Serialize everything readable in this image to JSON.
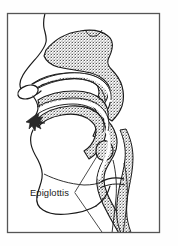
{
  "figure": {
    "kind": "anatomical-line-drawing",
    "frame": {
      "visible": true,
      "stroke_color": "#555555",
      "x": 7,
      "y": 13,
      "width": 153,
      "height": 220
    },
    "background_color": "#fefefe",
    "ink_color": "#1a1a1a",
    "tissue_fill_color": "#9a9a9a",
    "airway_fill_color": "#ffffff"
  },
  "labels": [
    {
      "id": "epiglottis",
      "text": "Epiglottis",
      "x": 30,
      "y": 194,
      "leader_line": true,
      "leader_color": "#2a2a2a"
    }
  ],
  "structures": [
    {
      "id": "nasal-cavity",
      "name": "Nasal cavity"
    },
    {
      "id": "hard-palate",
      "name": "Hard palate"
    },
    {
      "id": "soft-palate",
      "name": "Soft palate / velum"
    },
    {
      "id": "tongue",
      "name": "Tongue"
    },
    {
      "id": "pharynx",
      "name": "Pharynx"
    },
    {
      "id": "epiglottis-structure",
      "name": "Epiglottis"
    },
    {
      "id": "larynx",
      "name": "Larynx"
    },
    {
      "id": "trachea",
      "name": "Trachea"
    },
    {
      "id": "esophagus",
      "name": "Esophagus"
    },
    {
      "id": "face-profile",
      "name": "Face profile outline"
    },
    {
      "id": "lips-teeth",
      "name": "Lips and teeth"
    },
    {
      "id": "nostril",
      "name": "Nostril opening"
    },
    {
      "id": "jaw-chin",
      "name": "Jaw and chin outline"
    }
  ]
}
